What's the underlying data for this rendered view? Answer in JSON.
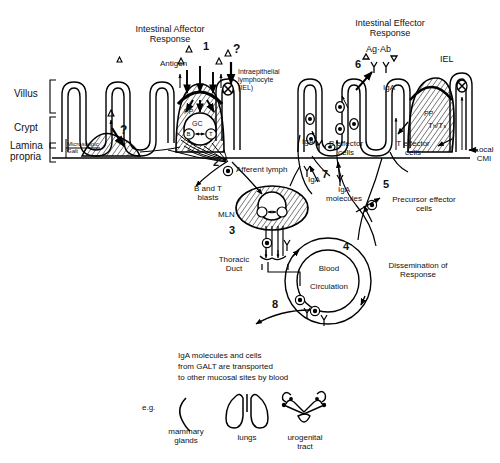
{
  "figure": {
    "title_left": "Intestinal Affector\nResponse",
    "title_right": "Intestinal Effector\nResponse"
  },
  "axis_labels": {
    "villus": "Villus",
    "crypt": "Crypt",
    "lamina_propria": "Lamina\npropria",
    "microscopic_galt": "Microscopic\nGalt"
  },
  "affector": {
    "antigen": "Antigen",
    "iel_label": "Intraepithelial\nlymphocyte\n(IEL)",
    "pp": "PP",
    "gc": "GC",
    "b_cell": "B",
    "t_cell": "T",
    "question_1": "?",
    "question_2": "?",
    "afferent_lymph": "Afferent lymph",
    "b_and_t_blasts": "B and T\nblasts",
    "mln": "MLN",
    "thoracic_duct": "Thoracic\nDuct",
    "blood_circulation": "Blood\n\nCirculation"
  },
  "effector": {
    "ag_ab": "Ag·Ab",
    "iel": "IEL",
    "iga_top": "IgA",
    "iga_left": "IgA",
    "iga_lymph": "IgA",
    "iga_molecules": "IgA\nmolecules",
    "b_effector_cells": "B effector\ncells",
    "t_effector_cells": "T effector\ncells",
    "local_cmi": "Local\nCMI",
    "pp": "PP",
    "th_ts": "Tₕ/Tₛ",
    "precursor_effector_cells": "Precursor effector\ncells",
    "dissemination": "Dissemination of\nResponse"
  },
  "numbers": {
    "n1": "1",
    "n2": "2",
    "n3": "3",
    "n4": "4",
    "n5": "5",
    "n6": "6",
    "n7": "7",
    "n8": "8"
  },
  "caption": {
    "line1": "IgA molecules and cells",
    "line2": "from GALT are transported",
    "line3": "to other mucosal sites by blood",
    "eg": "e.g.",
    "organ1": "mammary\nglands",
    "organ2": "lungs",
    "organ3": "urogenital\ntract"
  },
  "colors": {
    "ink": "#000000",
    "background": "#ffffff"
  }
}
